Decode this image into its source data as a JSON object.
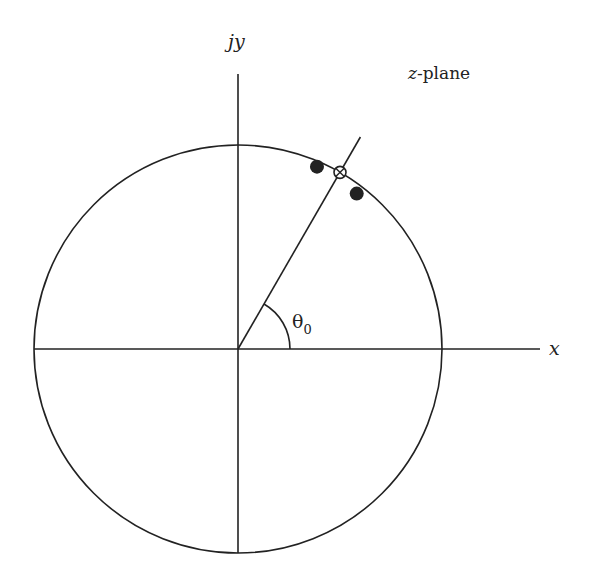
{
  "labels": {
    "y_axis": "jy",
    "x_axis": "x",
    "plane": "z-plane",
    "plane_var": "z",
    "plane_rest": "-plane",
    "angle": "θ",
    "angle_sub": "0"
  },
  "diagram": {
    "unit_circle": true,
    "theta0_deg": 60,
    "zero": {
      "marker": "open-circle-with-x",
      "angle_deg": 60,
      "radius": 1.0
    },
    "poles": [
      {
        "marker": "filled-circle",
        "angle_deg": 66,
        "radius": 1.0
      },
      {
        "marker": "filled-circle",
        "angle_deg": 54,
        "radius": 0.99
      }
    ],
    "colors": {
      "stroke": "#222222"
    }
  }
}
